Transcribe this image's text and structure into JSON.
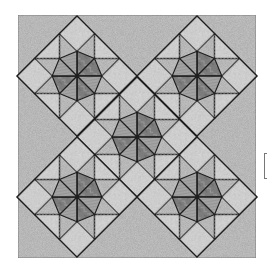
{
  "image": {
    "subject": "LeMoyne star quilt pattern, five star blocks set on point in an X arrangement",
    "width": 275,
    "height": 271
  },
  "quilt": {
    "frame": {
      "x": 18,
      "y": 15,
      "width": 238,
      "height": 243
    },
    "block_half_diagonal": 60,
    "blocks": [
      {
        "name": "block-top-left",
        "cx": 77,
        "cy": 76
      },
      {
        "name": "block-top-right",
        "cx": 197,
        "cy": 76
      },
      {
        "name": "block-center",
        "cx": 137,
        "cy": 137
      },
      {
        "name": "block-bottom-left",
        "cx": 77,
        "cy": 197
      },
      {
        "name": "block-bottom-right",
        "cx": 197,
        "cy": 197
      }
    ],
    "star_point_order": [
      "lace",
      "stripe",
      "lace",
      "stripe",
      "lace",
      "stripe",
      "lace",
      "stripe"
    ],
    "fabrics": {
      "background": "#c6c6c6",
      "light": "#dedede",
      "lace": "#7c7c7c",
      "stripe": "#a3a3a3",
      "seam": "#1e1e1e",
      "frame_border": "#8a8a8a"
    }
  },
  "bracket": {
    "x": 264,
    "y": 153,
    "height": 26
  }
}
